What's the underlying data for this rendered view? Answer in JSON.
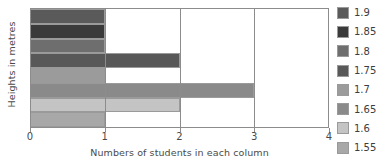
{
  "chart_data": {
    "type": "bar",
    "orientation": "horizontal",
    "title": "",
    "xlabel": "Numbers of students in each column",
    "ylabel": "Heights in metres",
    "categories": [
      "1.9",
      "1.85",
      "1.8",
      "1.75",
      "1.7",
      "1.65",
      "1.6",
      "1.55"
    ],
    "values": [
      1,
      1,
      1,
      2,
      1,
      3,
      2,
      1
    ],
    "xlim": [
      0,
      4
    ],
    "xticks": [
      "0",
      "1",
      "2",
      "3",
      "4"
    ],
    "grid": true,
    "legend_position": "right",
    "series": [
      {
        "name": "Numbers of students in each column",
        "points": [
          {
            "category": "1.9",
            "value": 1,
            "color": "#5a5a5a"
          },
          {
            "category": "1.85",
            "value": 1,
            "color": "#3a3a3a"
          },
          {
            "category": "1.8",
            "value": 1,
            "color": "#6e6e6e"
          },
          {
            "category": "1.75",
            "value": 2,
            "color": "#585858"
          },
          {
            "category": "1.7",
            "value": 1,
            "color": "#9b9b9b"
          },
          {
            "category": "1.65",
            "value": 3,
            "color": "#8a8a8a"
          },
          {
            "category": "1.6",
            "value": 2,
            "color": "#c4c4c4"
          },
          {
            "category": "1.55",
            "value": 1,
            "color": "#a8a8a8"
          }
        ]
      }
    ]
  },
  "legend": {
    "items": [
      {
        "label": "1.9",
        "color": "#5a5a5a"
      },
      {
        "label": "1.85",
        "color": "#3a3a3a"
      },
      {
        "label": "1.8",
        "color": "#6e6e6e"
      },
      {
        "label": "1.75",
        "color": "#585858"
      },
      {
        "label": "1.7",
        "color": "#9b9b9b"
      },
      {
        "label": "1.65",
        "color": "#8a8a8a"
      },
      {
        "label": "1.6",
        "color": "#c4c4c4"
      },
      {
        "label": "1.55",
        "color": "#a8a8a8"
      }
    ]
  },
  "axes": {
    "x_title": "Numbers of students in each column",
    "y_title": "Heights in metres",
    "x_ticks": [
      "0",
      "1",
      "2",
      "3",
      "4"
    ]
  },
  "colors": {
    "frame": "#8c8c8c",
    "text": "#4a4a4a",
    "background": "#ffffff"
  }
}
